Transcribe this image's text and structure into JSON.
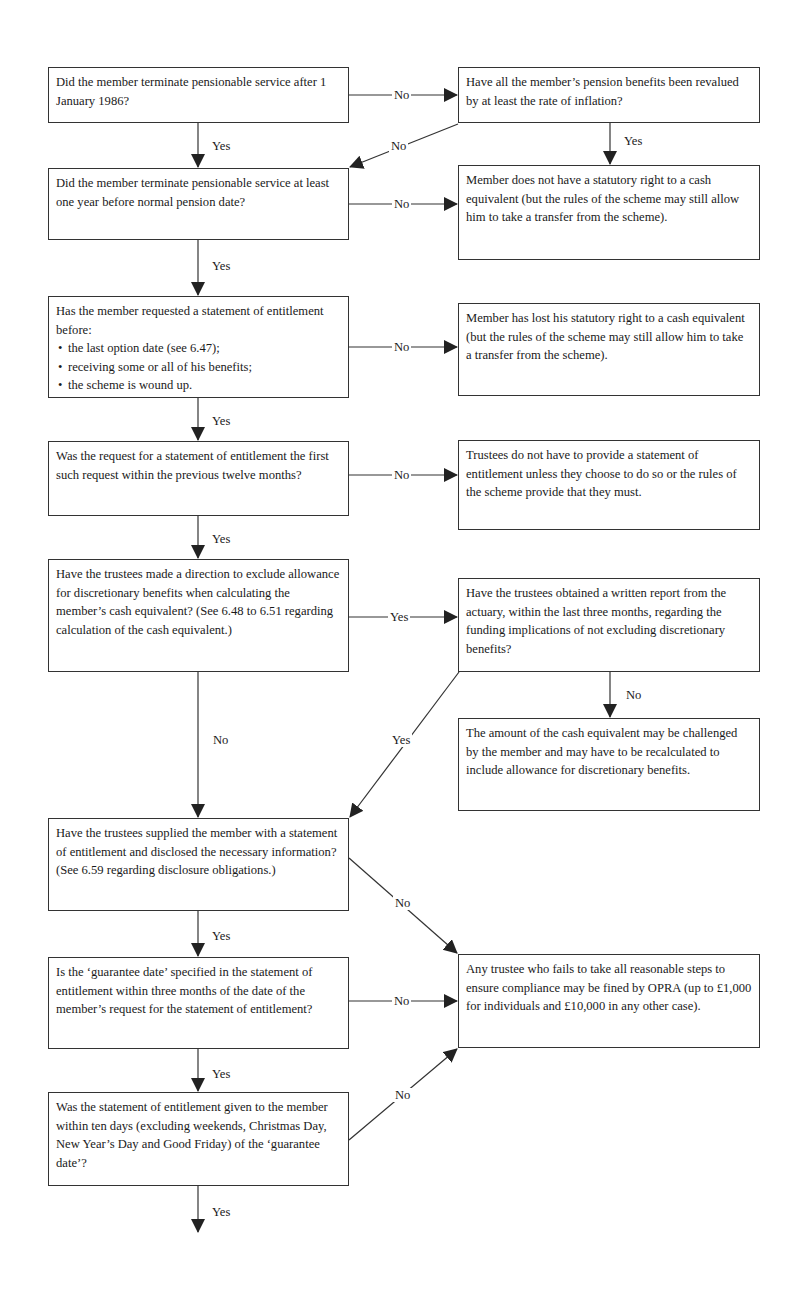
{
  "boxes": {
    "q1": "Did the member terminate pensionable service after 1 January 1986?",
    "q1_no": "Have all the member’s pension benefits been revalued by at least the rate of inflation?",
    "q2": "Did the member terminate pensionable service at least one year before normal pension date?",
    "q2_no": "Member does not have a statutory right to a cash equivalent (but the rules of the scheme may still allow him to take a transfer from the scheme).",
    "q3_intro": "Has the member requested a statement of entitlement before:",
    "q3_items": [
      "the last option date (see 6.47);",
      "receiving some or all of his benefits;",
      "the scheme is wound up."
    ],
    "q3_no": "Member has lost his statutory right to a cash equivalent (but the rules of the scheme may still allow him to take a transfer from the scheme).",
    "q4": "Was the request for a statement of entitlement the first such request within the previous twelve months?",
    "q4_no": "Trustees do not have to provide a statement of entitlement unless they choose to do so or the rules of the scheme provide that they must.",
    "q5": "Have the trustees made a direction to exclude allowance for discretionary benefits when calculating the member’s cash equivalent? (See 6.48 to 6.51 regarding calculation of the cash equivalent.)",
    "q5_yes": "Have the trustees obtained a written report from the actuary, within the last three months, regarding the funding implications of not excluding discretionary benefits?",
    "q5_yes_no": "The amount of the cash equivalent may be challenged by the member and may have to be recalculated to include allowance for discretionary benefits.",
    "q6": "Have the trustees supplied the member with a statement of entitlement and disclosed the necessary information? (See 6.59 regarding disclosure obligations.)",
    "q7": "Is the ‘guarantee date’ specified in the statement of entitlement within three months of the date of the member’s request for the statement of entitlement?",
    "q8": "Was the statement of entitlement given to the member within ten days (excluding weekends, Christmas Day, New Year’s Day and Good Friday) of the ‘guarantee date’?",
    "opra": "Any trustee who fails to take all reasonable steps to ensure compliance may be fined by OPRA (up to £1,000 for individuals and £10,000 in any other case)."
  },
  "labels": {
    "yes": "Yes",
    "no": "No"
  },
  "colors": {
    "line": "#333333",
    "background": "#ffffff",
    "text": "#1a1a1a"
  }
}
